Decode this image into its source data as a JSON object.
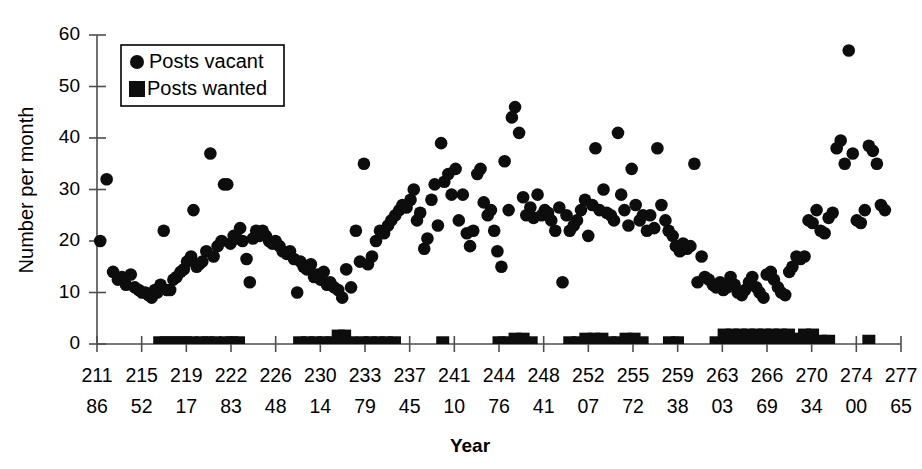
{
  "chart": {
    "title": "",
    "y_axis_label": "Number per month",
    "x_axis_label": "Year"
  },
  "legend": {
    "items": [
      {
        "label": "Posts vacant",
        "marker": "circle-marker"
      },
      {
        "label": "Posts wanted",
        "marker": "square-marker"
      }
    ]
  },
  "y_ticks": [
    "0",
    "10",
    "20",
    "30",
    "40",
    "50",
    "60"
  ],
  "x_tick_labels_top": [
    "211",
    "215",
    "219",
    "222",
    "226",
    "230",
    "233",
    "237",
    "241",
    "244",
    "248",
    "252",
    "255",
    "259",
    "263",
    "266",
    "270",
    "274",
    "277"
  ],
  "x_tick_labels_bottom": [
    "86",
    "52",
    "17",
    "83",
    "48",
    "14",
    "79",
    "45",
    "10",
    "76",
    "41",
    "07",
    "72",
    "38",
    "03",
    "69",
    "34",
    "00",
    "65"
  ],
  "chart_data": {
    "type": "scatter",
    "title": "",
    "xlabel": "Year",
    "ylabel": "Number per month",
    "ylim": [
      0,
      60
    ],
    "xlim": [
      21186,
      27765
    ],
    "grid": false,
    "legend_position": "top-left",
    "x_tick_values": [
      21186,
      21552,
      21917,
      22283,
      22648,
      23014,
      23379,
      23745,
      24110,
      24476,
      24841,
      25207,
      25572,
      25938,
      26303,
      26669,
      27034,
      27400,
      27765
    ],
    "x_tick_labels": [
      "211\n86",
      "215\n52",
      "219\n17",
      "222\n83",
      "226\n48",
      "230\n14",
      "233\n79",
      "237\n45",
      "241\n10",
      "244\n76",
      "248\n41",
      "252\n07",
      "255\n72",
      "259\n38",
      "263\n03",
      "266\n69",
      "270\n34",
      "274\n00",
      "277\n65"
    ],
    "series": [
      {
        "name": "Posts vacant",
        "marker": "circle",
        "color": "#0d0d0d",
        "points": [
          [
            0.004,
            20.0
          ],
          [
            0.012,
            32.0
          ],
          [
            0.02,
            14.0
          ],
          [
            0.026,
            12.5
          ],
          [
            0.031,
            13.0
          ],
          [
            0.036,
            11.5
          ],
          [
            0.042,
            13.5
          ],
          [
            0.047,
            11.0
          ],
          [
            0.052,
            10.5
          ],
          [
            0.056,
            10.0
          ],
          [
            0.06,
            10.0
          ],
          [
            0.064,
            9.5
          ],
          [
            0.068,
            9.0
          ],
          [
            0.072,
            10.5
          ],
          [
            0.075,
            10.0
          ],
          [
            0.079,
            11.5
          ],
          [
            0.083,
            22.0
          ],
          [
            0.087,
            10.5
          ],
          [
            0.091,
            10.5
          ],
          [
            0.095,
            12.5
          ],
          [
            0.099,
            13.0
          ],
          [
            0.104,
            14.0
          ],
          [
            0.108,
            14.5
          ],
          [
            0.112,
            16.0
          ],
          [
            0.117,
            17.0
          ],
          [
            0.12,
            26.0
          ],
          [
            0.124,
            15.0
          ],
          [
            0.127,
            15.5
          ],
          [
            0.131,
            16.0
          ],
          [
            0.136,
            18.0
          ],
          [
            0.141,
            37.0
          ],
          [
            0.145,
            17.0
          ],
          [
            0.15,
            19.0
          ],
          [
            0.155,
            20.0
          ],
          [
            0.158,
            31.0
          ],
          [
            0.162,
            31.0
          ],
          [
            0.166,
            19.5
          ],
          [
            0.17,
            21.0
          ],
          [
            0.174,
            20.5
          ],
          [
            0.178,
            22.5
          ],
          [
            0.181,
            20.0
          ],
          [
            0.186,
            16.5
          ],
          [
            0.19,
            12.0
          ],
          [
            0.194,
            20.5
          ],
          [
            0.198,
            22.0
          ],
          [
            0.202,
            21.0
          ],
          [
            0.206,
            22.0
          ],
          [
            0.21,
            21.0
          ],
          [
            0.214,
            20.0
          ],
          [
            0.218,
            19.5
          ],
          [
            0.222,
            20.0
          ],
          [
            0.227,
            19.0
          ],
          [
            0.231,
            18.0
          ],
          [
            0.236,
            17.5
          ],
          [
            0.24,
            18.0
          ],
          [
            0.245,
            16.5
          ],
          [
            0.249,
            10.0
          ],
          [
            0.253,
            16.0
          ],
          [
            0.257,
            15.0
          ],
          [
            0.261,
            14.5
          ],
          [
            0.266,
            15.5
          ],
          [
            0.27,
            13.0
          ],
          [
            0.274,
            13.5
          ],
          [
            0.278,
            12.5
          ],
          [
            0.282,
            14.0
          ],
          [
            0.286,
            11.5
          ],
          [
            0.29,
            12.0
          ],
          [
            0.295,
            11.0
          ],
          [
            0.3,
            10.5
          ],
          [
            0.305,
            9.0
          ],
          [
            0.31,
            14.5
          ],
          [
            0.316,
            11.0
          ],
          [
            0.322,
            22.0
          ],
          [
            0.327,
            16.0
          ],
          [
            0.332,
            35.0
          ],
          [
            0.337,
            15.5
          ],
          [
            0.342,
            17.0
          ],
          [
            0.347,
            20.0
          ],
          [
            0.352,
            22.0
          ],
          [
            0.357,
            21.5
          ],
          [
            0.362,
            23.0
          ],
          [
            0.366,
            24.0
          ],
          [
            0.371,
            25.0
          ],
          [
            0.376,
            26.0
          ],
          [
            0.38,
            27.0
          ],
          [
            0.385,
            26.5
          ],
          [
            0.39,
            28.0
          ],
          [
            0.394,
            30.0
          ],
          [
            0.398,
            24.0
          ],
          [
            0.402,
            25.5
          ],
          [
            0.407,
            18.5
          ],
          [
            0.411,
            20.5
          ],
          [
            0.416,
            28.0
          ],
          [
            0.42,
            31.0
          ],
          [
            0.424,
            23.0
          ],
          [
            0.428,
            39.0
          ],
          [
            0.432,
            31.5
          ],
          [
            0.437,
            33.0
          ],
          [
            0.441,
            29.0
          ],
          [
            0.446,
            34.0
          ],
          [
            0.45,
            24.0
          ],
          [
            0.455,
            29.0
          ],
          [
            0.46,
            21.5
          ],
          [
            0.464,
            19.0
          ],
          [
            0.468,
            22.0
          ],
          [
            0.473,
            33.0
          ],
          [
            0.477,
            34.0
          ],
          [
            0.481,
            27.5
          ],
          [
            0.486,
            25.0
          ],
          [
            0.49,
            26.0
          ],
          [
            0.494,
            22.0
          ],
          [
            0.498,
            18.0
          ],
          [
            0.503,
            15.0
          ],
          [
            0.507,
            35.5
          ],
          [
            0.512,
            26.0
          ],
          [
            0.516,
            44.0
          ],
          [
            0.52,
            46.0
          ],
          [
            0.525,
            41.0
          ],
          [
            0.53,
            28.5
          ],
          [
            0.534,
            25.0
          ],
          [
            0.539,
            26.5
          ],
          [
            0.543,
            24.5
          ],
          [
            0.548,
            29.0
          ],
          [
            0.553,
            25.0
          ],
          [
            0.557,
            26.0
          ],
          [
            0.561,
            25.5
          ],
          [
            0.565,
            24.0
          ],
          [
            0.57,
            22.0
          ],
          [
            0.575,
            26.5
          ],
          [
            0.579,
            12.0
          ],
          [
            0.584,
            25.0
          ],
          [
            0.588,
            22.0
          ],
          [
            0.593,
            23.0
          ],
          [
            0.597,
            24.0
          ],
          [
            0.602,
            26.0
          ],
          [
            0.607,
            28.0
          ],
          [
            0.611,
            21.0
          ],
          [
            0.616,
            27.0
          ],
          [
            0.62,
            38.0
          ],
          [
            0.625,
            26.0
          ],
          [
            0.63,
            30.0
          ],
          [
            0.634,
            25.5
          ],
          [
            0.639,
            25.0
          ],
          [
            0.643,
            24.0
          ],
          [
            0.648,
            41.0
          ],
          [
            0.652,
            29.0
          ],
          [
            0.656,
            26.0
          ],
          [
            0.661,
            23.0
          ],
          [
            0.665,
            34.0
          ],
          [
            0.67,
            27.0
          ],
          [
            0.675,
            24.0
          ],
          [
            0.679,
            25.0
          ],
          [
            0.684,
            22.0
          ],
          [
            0.688,
            25.0
          ],
          [
            0.693,
            22.5
          ],
          [
            0.697,
            38.0
          ],
          [
            0.702,
            27.0
          ],
          [
            0.707,
            24.0
          ],
          [
            0.711,
            22.0
          ],
          [
            0.716,
            21.0
          ],
          [
            0.72,
            19.0
          ],
          [
            0.725,
            18.0
          ],
          [
            0.729,
            19.5
          ],
          [
            0.734,
            18.5
          ],
          [
            0.738,
            19.0
          ],
          [
            0.743,
            35.0
          ],
          [
            0.747,
            12.0
          ],
          [
            0.752,
            17.0
          ],
          [
            0.756,
            13.0
          ],
          [
            0.761,
            12.5
          ],
          [
            0.766,
            11.5
          ],
          [
            0.77,
            11.0
          ],
          [
            0.775,
            12.0
          ],
          [
            0.779,
            10.5
          ],
          [
            0.784,
            11.0
          ],
          [
            0.788,
            13.0
          ],
          [
            0.793,
            11.5
          ],
          [
            0.797,
            10.0
          ],
          [
            0.802,
            9.5
          ],
          [
            0.806,
            10.5
          ],
          [
            0.811,
            12.0
          ],
          [
            0.815,
            13.0
          ],
          [
            0.82,
            11.0
          ],
          [
            0.824,
            10.0
          ],
          [
            0.829,
            9.0
          ],
          [
            0.833,
            13.5
          ],
          [
            0.838,
            14.0
          ],
          [
            0.842,
            12.5
          ],
          [
            0.847,
            11.0
          ],
          [
            0.851,
            10.0
          ],
          [
            0.856,
            9.5
          ],
          [
            0.861,
            14.0
          ],
          [
            0.865,
            15.0
          ],
          [
            0.87,
            17.0
          ],
          [
            0.875,
            16.5
          ],
          [
            0.88,
            17.0
          ],
          [
            0.885,
            24.0
          ],
          [
            0.89,
            23.5
          ],
          [
            0.895,
            26.0
          ],
          [
            0.9,
            22.0
          ],
          [
            0.905,
            21.5
          ],
          [
            0.91,
            24.5
          ],
          [
            0.915,
            25.5
          ],
          [
            0.92,
            38.0
          ],
          [
            0.925,
            39.5
          ],
          [
            0.93,
            35.0
          ],
          [
            0.935,
            57.0
          ],
          [
            0.94,
            37.0
          ],
          [
            0.945,
            24.0
          ],
          [
            0.95,
            23.5
          ],
          [
            0.955,
            26.0
          ],
          [
            0.96,
            38.5
          ],
          [
            0.965,
            37.5
          ],
          [
            0.97,
            35.0
          ],
          [
            0.975,
            27.0
          ],
          [
            0.98,
            26.0
          ]
        ]
      },
      {
        "name": "Posts wanted",
        "marker": "square",
        "color": "#0d0d0d",
        "points": [
          [
            0.078,
            1.5
          ],
          [
            0.086,
            1.5
          ],
          [
            0.094,
            1.5
          ],
          [
            0.102,
            1.5
          ],
          [
            0.11,
            1.5
          ],
          [
            0.118,
            1.5
          ],
          [
            0.13,
            1.5
          ],
          [
            0.138,
            1.5
          ],
          [
            0.147,
            1.5
          ],
          [
            0.16,
            1.5
          ],
          [
            0.168,
            1.5
          ],
          [
            0.176,
            1.5
          ],
          [
            0.252,
            1.5
          ],
          [
            0.262,
            1.5
          ],
          [
            0.272,
            1.5
          ],
          [
            0.282,
            1.5
          ],
          [
            0.292,
            1.5
          ],
          [
            0.3,
            2.8
          ],
          [
            0.308,
            2.8
          ],
          [
            0.316,
            1.5
          ],
          [
            0.33,
            1.5
          ],
          [
            0.34,
            1.5
          ],
          [
            0.35,
            1.5
          ],
          [
            0.36,
            1.5
          ],
          [
            0.37,
            1.5
          ],
          [
            0.43,
            1.5
          ],
          [
            0.5,
            1.5
          ],
          [
            0.51,
            1.5
          ],
          [
            0.52,
            2.2
          ],
          [
            0.53,
            2.2
          ],
          [
            0.54,
            1.5
          ],
          [
            0.588,
            1.5
          ],
          [
            0.598,
            1.5
          ],
          [
            0.608,
            2.2
          ],
          [
            0.618,
            2.2
          ],
          [
            0.628,
            2.2
          ],
          [
            0.638,
            1.5
          ],
          [
            0.648,
            1.5
          ],
          [
            0.658,
            2.2
          ],
          [
            0.668,
            2.2
          ],
          [
            0.678,
            1.5
          ],
          [
            0.712,
            1.5
          ],
          [
            0.722,
            1.5
          ],
          [
            0.77,
            1.5
          ],
          [
            0.78,
            3.0
          ],
          [
            0.79,
            3.0
          ],
          [
            0.8,
            3.0
          ],
          [
            0.81,
            3.0
          ],
          [
            0.82,
            3.0
          ],
          [
            0.83,
            3.0
          ],
          [
            0.84,
            3.0
          ],
          [
            0.85,
            3.0
          ],
          [
            0.86,
            3.0
          ],
          [
            0.87,
            2.2
          ],
          [
            0.88,
            3.0
          ],
          [
            0.89,
            3.0
          ],
          [
            0.9,
            1.8
          ],
          [
            0.91,
            1.8
          ],
          [
            0.96,
            1.8
          ]
        ]
      }
    ]
  }
}
